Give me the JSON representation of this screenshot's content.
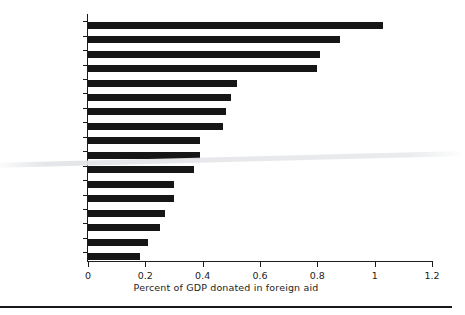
{
  "chart_data": {
    "type": "bar",
    "orientation": "horizontal",
    "title": "",
    "xlabel": "Percent of GDP donated in foreign aid",
    "ylabel": "",
    "xlim": [
      0,
      1.2
    ],
    "grid": false,
    "legend": null,
    "xticks": [
      "0",
      "0.2",
      "0.4",
      "0.6",
      "0.8",
      "1",
      "1.2"
    ],
    "xtick_values": [
      0,
      0.2,
      0.4,
      0.6,
      0.8,
      1,
      1.2
    ],
    "categories": [
      "Sweden",
      "Norway",
      "Netherlands",
      "Denmark",
      "United Kingdom",
      "Belgium",
      "Austria",
      "France",
      "Switzerland",
      "Finland",
      "Germany",
      "Canada",
      "Australia",
      "New Zealand",
      "Japan",
      "Italy",
      "USA"
    ],
    "values": [
      1.03,
      0.88,
      0.81,
      0.8,
      0.52,
      0.5,
      0.48,
      0.47,
      0.39,
      0.39,
      0.37,
      0.3,
      0.3,
      0.27,
      0.25,
      0.21,
      0.18
    ],
    "bar_color": "#161616",
    "axis_color": "#1c1c1c"
  }
}
